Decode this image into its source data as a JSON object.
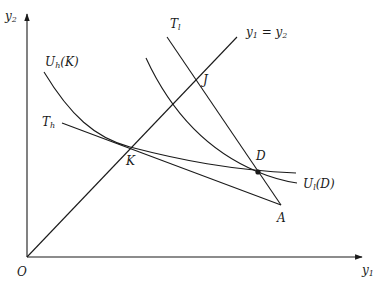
{
  "diagram": {
    "axes": {
      "x_label": "y",
      "x_label_sub": "1",
      "y_label": "y",
      "y_label_sub": "2",
      "origin_label": "O"
    },
    "lines": {
      "diagonal_label_lhs": "y",
      "diagonal_label_lhs_sub": "1",
      "diagonal_label_eq": " = ",
      "diagonal_label_rhs": "y",
      "diagonal_label_rhs_sub": "2",
      "t_low_label": "T",
      "t_low_sub": "l",
      "t_high_label": "T",
      "t_high_sub": "h"
    },
    "curves": {
      "u_high_label": "U",
      "u_high_sub": "h",
      "u_high_arg": "(K)",
      "u_low_label": "U",
      "u_low_sub": "l",
      "u_low_arg": "(D)"
    },
    "points": {
      "K": "K",
      "J": "J",
      "D": "D",
      "A": "A"
    },
    "colors": {
      "ink": "#1a1a1a",
      "background": "#ffffff"
    }
  }
}
